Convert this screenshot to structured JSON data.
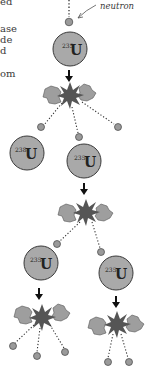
{
  "clipped_text_lines": [
    {
      "text": "ed",
      "y": -4
    },
    {
      "text": "ase",
      "y": 23
    },
    {
      "text": "de",
      "y": 34
    },
    {
      "text": "d",
      "y": 45
    },
    {
      "text": "om",
      "y": 68
    }
  ],
  "labels": {
    "neutron": "neutron"
  },
  "nuclei": [
    {
      "isotope": "235",
      "element": "U",
      "cx": 70,
      "cy": 49
    },
    {
      "isotope": "238",
      "element": "U",
      "cx": 27,
      "cy": 153
    },
    {
      "isotope": "235",
      "element": "U",
      "cx": 84,
      "cy": 161
    },
    {
      "isotope": "235",
      "element": "U",
      "cx": 41,
      "cy": 263
    },
    {
      "isotope": "235",
      "element": "U",
      "cx": 116,
      "cy": 273
    }
  ],
  "colors": {
    "nucleus_fill": "#a9a9a9",
    "nucleus_stroke": "#3a3a3a",
    "fragment_fill": "#9e9e9e",
    "burst_fill": "#555555",
    "neutron_fill": "#9a9a9a",
    "arrow": "#111111"
  }
}
